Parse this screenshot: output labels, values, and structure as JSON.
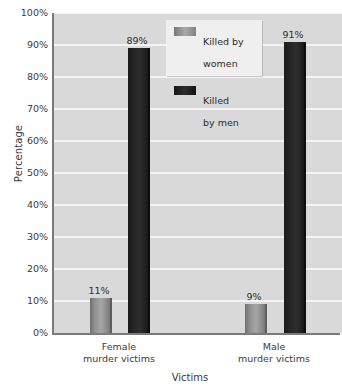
{
  "chart_data": {
    "type": "bar",
    "title": "",
    "xlabel": "Victims",
    "ylabel": "Percentage",
    "categories": [
      "Female\nmurder victims",
      "Male\nmurder victims"
    ],
    "series": [
      {
        "name": "Killed by\nwomen",
        "values": [
          11,
          9
        ],
        "value_labels": [
          "11%",
          "9%"
        ],
        "color": "#a6a6a6"
      },
      {
        "name": "Killed\nby men",
        "values": [
          89,
          91
        ],
        "value_labels": [
          "89%",
          "91%"
        ],
        "color": "#222222"
      }
    ],
    "ylim": [
      0,
      100
    ],
    "ytick_labels": [
      "0%",
      "10%",
      "20%",
      "30%",
      "40%",
      "50%",
      "60%",
      "70%",
      "80%",
      "90%",
      "100%"
    ],
    "ytick_values": [
      0,
      10,
      20,
      30,
      40,
      50,
      60,
      70,
      80,
      90,
      100
    ],
    "grid": true,
    "legend_position": "top-center",
    "plot_background": "#d9d9d9",
    "gridline_color": "#f3f3f3",
    "axis_color": "#7a7a7a"
  },
  "axes": {
    "y_title": "Percentage",
    "x_title": "Victims"
  },
  "ticks": {
    "y": [
      {
        "label": "100%",
        "value": 100
      },
      {
        "label": "90%",
        "value": 90
      },
      {
        "label": "80%",
        "value": 80
      },
      {
        "label": "70%",
        "value": 70
      },
      {
        "label": "60%",
        "value": 60
      },
      {
        "label": "50%",
        "value": 50
      },
      {
        "label": "40%",
        "value": 40
      },
      {
        "label": "30%",
        "value": 30
      },
      {
        "label": "20%",
        "value": 20
      },
      {
        "label": "10%",
        "value": 10
      },
      {
        "label": "0%",
        "value": 0
      }
    ]
  },
  "groups": [
    {
      "label_line1": "Female",
      "label_line2": "murder victims",
      "bars": [
        {
          "series": "Killed by women",
          "value": 11,
          "label": "11%"
        },
        {
          "series": "Killed by men",
          "value": 89,
          "label": "89%"
        }
      ]
    },
    {
      "label_line1": "Male",
      "label_line2": "murder victims",
      "bars": [
        {
          "series": "Killed by women",
          "value": 9,
          "label": "9%"
        },
        {
          "series": "Killed by men",
          "value": 91,
          "label": "91%"
        }
      ]
    }
  ],
  "legend": {
    "items": [
      {
        "label_line1": "Killed by",
        "label_line2": "women",
        "swatch": "light-gray"
      },
      {
        "label_line1": "Killed",
        "label_line2": "by men",
        "swatch": "black"
      }
    ]
  }
}
